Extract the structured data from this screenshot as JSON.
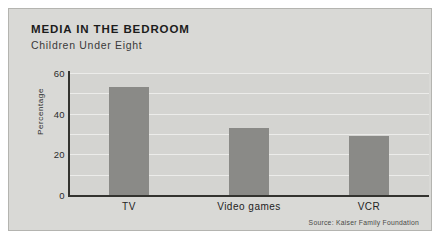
{
  "chart_data": {
    "type": "bar",
    "title": "MEDIA IN THE BEDROOM",
    "subtitle": "Children Under Eight",
    "categories": [
      "TV",
      "Video games",
      "VCR"
    ],
    "values": [
      53,
      33,
      29
    ],
    "series": [
      {
        "name": "Percentage",
        "values": [
          53,
          33,
          29
        ]
      }
    ],
    "xlabel": "",
    "ylabel": "Percentage",
    "ylim": [
      0,
      60
    ],
    "yticks": [
      0,
      20,
      40,
      60
    ],
    "ytick_labels": [
      "0",
      "20",
      "40",
      "60"
    ],
    "gridlines": [
      10,
      20,
      30,
      40,
      50,
      60
    ],
    "grid": true,
    "legend": "none",
    "source": "Source: Kaiser Family Foundation",
    "bar_color": "#8a8a87",
    "background_color": "#d9d9d6",
    "gridline_color": "#ececea",
    "axis_color": "#33332f"
  }
}
